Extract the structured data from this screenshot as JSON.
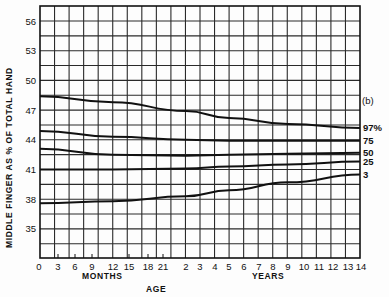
{
  "chart_data": {
    "type": "line",
    "panel_label": "(b)",
    "title": "",
    "xlabel": "AGE",
    "x_sublabels": [
      "MONTHS",
      "YEARS"
    ],
    "ylabel": "MIDDLE FINGER AS % OF TOTAL HAND",
    "ylim": [
      32,
      57.5
    ],
    "yticks": [
      35,
      38,
      41,
      44,
      47,
      50,
      53,
      56
    ],
    "grid": true,
    "x_tick_labels": [
      "0",
      "3",
      "6",
      "9",
      "12",
      "15",
      "18",
      "21",
      "2",
      "3",
      "4",
      "5",
      "6",
      "7",
      "8",
      "9",
      "10",
      "11",
      "12",
      "13",
      "14"
    ],
    "x_units": [
      "months",
      "months",
      "months",
      "months",
      "months",
      "months",
      "months",
      "months",
      "years",
      "years",
      "years",
      "years",
      "years",
      "years",
      "years",
      "years",
      "years",
      "years",
      "years",
      "years",
      "years"
    ],
    "x": [
      "0 mo",
      "1 yr",
      "2 yr",
      "5 yr",
      "9 yr",
      "14 yr"
    ],
    "series": [
      {
        "name": "97%",
        "values": [
          48.4,
          47.8,
          46.9,
          46.2,
          45.6,
          45.2
        ]
      },
      {
        "name": "75",
        "values": [
          44.9,
          44.3,
          44.0,
          43.9,
          43.9,
          43.9
        ]
      },
      {
        "name": "50",
        "values": [
          43.1,
          42.5,
          42.4,
          42.5,
          42.6,
          42.7
        ]
      },
      {
        "name": "25",
        "values": [
          41.0,
          41.0,
          41.1,
          41.3,
          41.5,
          41.8
        ]
      },
      {
        "name": "3",
        "values": [
          37.6,
          37.8,
          38.3,
          38.9,
          39.7,
          40.5
        ]
      }
    ],
    "legend_position": "right (inline end labels)"
  }
}
